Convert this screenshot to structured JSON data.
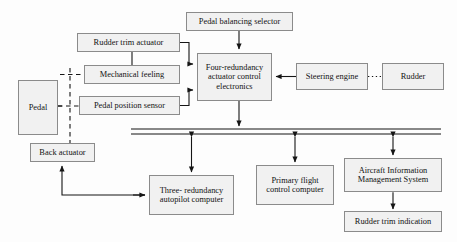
{
  "diagram": {
    "style": {
      "box_fill": "#f1f1f1",
      "box_border": "#8b8b8b",
      "line_color": "#1a1a1a",
      "background": "#fdfdfd"
    },
    "nodes": [
      {
        "id": "pedal_balancing_selector",
        "label": "Pedal balancing selector",
        "x": 186,
        "y": 12,
        "w": 107,
        "h": 19
      },
      {
        "id": "rudder_trim_actuator",
        "label": "Rudder trim actuator",
        "x": 77,
        "y": 33,
        "w": 103,
        "h": 19
      },
      {
        "id": "mechanical_feeling",
        "label": "Mechanical feeling",
        "x": 84,
        "y": 65,
        "w": 96,
        "h": 19
      },
      {
        "id": "pedal_position_sensor",
        "label": "Pedal position sensor",
        "x": 79,
        "y": 96,
        "w": 101,
        "h": 19
      },
      {
        "id": "pedal",
        "label": "Pedal",
        "x": 18,
        "y": 80,
        "w": 40,
        "h": 55
      },
      {
        "id": "four_redundancy_ace",
        "label": "Four-redundancy actuator control electronics",
        "x": 197,
        "y": 53,
        "w": 75,
        "h": 48
      },
      {
        "id": "steering_engine",
        "label": "Steering engine",
        "x": 296,
        "y": 63,
        "w": 72,
        "h": 27
      },
      {
        "id": "rudder",
        "label": "Rudder",
        "x": 382,
        "y": 63,
        "w": 62,
        "h": 27
      },
      {
        "id": "back_actuator",
        "label": "Back actuator",
        "x": 30,
        "y": 143,
        "w": 65,
        "h": 19
      },
      {
        "id": "three_redundancy_autopilot",
        "label": "Three- redundancy autopilot computer",
        "x": 149,
        "y": 175,
        "w": 85,
        "h": 40
      },
      {
        "id": "primary_flight_control_computer",
        "label": "Primary flight control computer",
        "x": 256,
        "y": 165,
        "w": 78,
        "h": 40
      },
      {
        "id": "aircraft_information_management_system",
        "label": "Aircraft Information Management System",
        "x": 344,
        "y": 158,
        "w": 98,
        "h": 34
      },
      {
        "id": "rudder_trim_indication",
        "label": "Rudder trim indication",
        "x": 344,
        "y": 211,
        "w": 98,
        "h": 21
      }
    ],
    "bus": {
      "label": "data bus",
      "x1": 131,
      "x2": 441,
      "y_top": 129,
      "y_bottom": 134
    },
    "connections": [
      {
        "from": "pedal_balancing_selector",
        "to": "four_redundancy_ace",
        "style": "solid",
        "arrow": "down"
      },
      {
        "from": "rudder_trim_actuator",
        "to": "four_redundancy_ace",
        "style": "solid",
        "arrow": "right"
      },
      {
        "from": "rudder_trim_actuator",
        "to": "mechanical_feeling",
        "style": "solid",
        "arrow": "none"
      },
      {
        "from": "pedal_position_sensor",
        "to": "four_redundancy_ace",
        "style": "solid",
        "arrow": "right"
      },
      {
        "from": "pedal",
        "to": "mechanical_feeling",
        "style": "dashed",
        "arrow": "none"
      },
      {
        "from": "pedal",
        "to": "pedal_position_sensor",
        "style": "dashed",
        "arrow": "none"
      },
      {
        "from": "pedal",
        "to": "back_actuator",
        "style": "dashed",
        "arrow": "none"
      },
      {
        "from": "steering_engine",
        "to": "four_redundancy_ace",
        "style": "solid",
        "arrow": "left"
      },
      {
        "from": "steering_engine",
        "to": "rudder",
        "style": "dotted",
        "arrow": "none"
      },
      {
        "from": "four_redundancy_ace",
        "to": "bus",
        "style": "solid",
        "arrow": "down"
      },
      {
        "from": "bus",
        "to": "three_redundancy_autopilot",
        "style": "solid",
        "arrow": "both"
      },
      {
        "from": "bus",
        "to": "primary_flight_control_computer",
        "style": "solid",
        "arrow": "both"
      },
      {
        "from": "bus",
        "to": "aircraft_information_management_system",
        "style": "solid",
        "arrow": "both"
      },
      {
        "from": "aircraft_information_management_system",
        "to": "rudder_trim_indication",
        "style": "solid",
        "arrow": "both"
      },
      {
        "from": "three_redundancy_autopilot",
        "to": "back_actuator",
        "style": "solid",
        "arrow": "up"
      }
    ]
  }
}
